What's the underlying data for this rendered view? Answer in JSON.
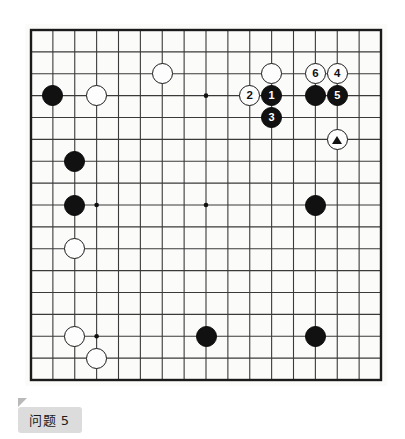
{
  "page": {
    "background_color": "#ffffff",
    "width": 405,
    "height": 439
  },
  "caption": {
    "text": "问题 5",
    "background_color": "#dcdcdc",
    "text_color": "#1b1b1b"
  },
  "board": {
    "name": "go-board",
    "columns": 17,
    "rows": 17,
    "origin_x": 6,
    "origin_y": 6,
    "spacing": 21.875,
    "line_color": "#3a3a3a",
    "border_color": "#1b1b1b",
    "background_color": "#fbfbf9",
    "stone_radius": 10.5,
    "star_points": [
      {
        "col": 3,
        "row": 3
      },
      {
        "col": 8,
        "row": 3
      },
      {
        "col": 13,
        "row": 3
      },
      {
        "col": 3,
        "row": 8
      },
      {
        "col": 8,
        "row": 8
      },
      {
        "col": 13,
        "row": 8
      },
      {
        "col": 3,
        "row": 14
      },
      {
        "col": 8,
        "row": 14
      },
      {
        "col": 13,
        "row": 14
      }
    ]
  },
  "stones": [
    {
      "id": "black-c1r3",
      "color": "black",
      "col": 1,
      "row": 3,
      "label": "",
      "marker": ""
    },
    {
      "id": "white-c3r3",
      "color": "white",
      "col": 3,
      "row": 3,
      "label": "",
      "marker": ""
    },
    {
      "id": "white-c6r2",
      "color": "white",
      "col": 6,
      "row": 2,
      "label": "",
      "marker": ""
    },
    {
      "id": "white-c11r2",
      "color": "white",
      "col": 11,
      "row": 2,
      "label": "",
      "marker": ""
    },
    {
      "id": "white-move2",
      "color": "white",
      "col": 10,
      "row": 3,
      "label": "2",
      "marker": ""
    },
    {
      "id": "black-move1",
      "color": "black",
      "col": 11,
      "row": 3,
      "label": "1",
      "marker": ""
    },
    {
      "id": "black-move3",
      "color": "black",
      "col": 11,
      "row": 4,
      "label": "3",
      "marker": ""
    },
    {
      "id": "white-move6",
      "color": "white",
      "col": 13,
      "row": 2,
      "label": "6",
      "marker": ""
    },
    {
      "id": "white-move4",
      "color": "white",
      "col": 14,
      "row": 2,
      "label": "4",
      "marker": ""
    },
    {
      "id": "black-c13r3",
      "color": "black",
      "col": 13,
      "row": 3,
      "label": "",
      "marker": ""
    },
    {
      "id": "black-move5",
      "color": "black",
      "col": 14,
      "row": 3,
      "label": "5",
      "marker": ""
    },
    {
      "id": "white-triangle",
      "color": "white",
      "col": 14,
      "row": 5,
      "label": "",
      "marker": "triangle"
    },
    {
      "id": "black-c2r6",
      "color": "black",
      "col": 2,
      "row": 6,
      "label": "",
      "marker": ""
    },
    {
      "id": "black-c2r8",
      "color": "black",
      "col": 2,
      "row": 8,
      "label": "",
      "marker": ""
    },
    {
      "id": "black-c13r8",
      "color": "black",
      "col": 13,
      "row": 8,
      "label": "",
      "marker": ""
    },
    {
      "id": "white-c2r10",
      "color": "white",
      "col": 2,
      "row": 10,
      "label": "",
      "marker": ""
    },
    {
      "id": "white-c2r14",
      "color": "white",
      "col": 2,
      "row": 14,
      "label": "",
      "marker": ""
    },
    {
      "id": "white-c3r15",
      "color": "white",
      "col": 3,
      "row": 15,
      "label": "",
      "marker": ""
    },
    {
      "id": "black-c8r14",
      "color": "black",
      "col": 8,
      "row": 14,
      "label": "",
      "marker": ""
    },
    {
      "id": "black-c13r14",
      "color": "black",
      "col": 13,
      "row": 14,
      "label": "",
      "marker": ""
    }
  ]
}
